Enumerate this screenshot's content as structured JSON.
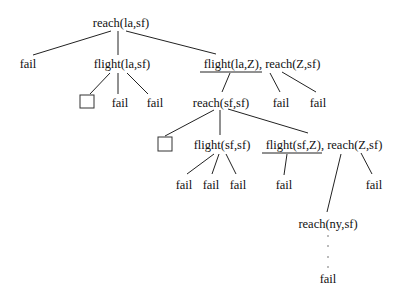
{
  "diagram": {
    "type": "search-tree",
    "nodes": {
      "root": "reach(la,sf)",
      "l1_fail": "fail",
      "l1_flight": "flight(la,sf)",
      "l1_conj": "flight(la,Z), reach(Z,sf)",
      "l2_fail_a": "fail",
      "l2_fail_b": "fail",
      "l2_reach": "reach(sf,sf)",
      "l2_fail_c": "fail",
      "l2_fail_d": "fail",
      "l3_flight": "flight(sf,sf)",
      "l3_conj": "flight(sf,Z), reach(Z,sf)",
      "l4_fail_a": "fail",
      "l4_fail_b": "fail",
      "l4_fail_c": "fail",
      "l4_fail_d": "fail",
      "l4_fail_e": "fail",
      "l5_reach": "reach(ny,sf)",
      "l6_fail": "fail"
    },
    "success_marker": "empty-box (success)",
    "continuation": "vertical ellipsis"
  }
}
